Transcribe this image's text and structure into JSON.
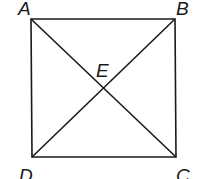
{
  "diagram": {
    "points": {
      "A": {
        "label": "A",
        "x": 31,
        "y": 19
      },
      "B": {
        "label": "B",
        "x": 175,
        "y": 19
      },
      "C": {
        "label": "C",
        "x": 176,
        "y": 157
      },
      "D": {
        "label": "D",
        "x": 32,
        "y": 157
      },
      "E": {
        "label": "E",
        "x": 103,
        "y": 88
      }
    },
    "segments": [
      "AB",
      "BC",
      "CD",
      "DA",
      "AC",
      "BD"
    ],
    "colors": {
      "stroke": "#1a1a1a",
      "background": "#ffffff"
    }
  }
}
